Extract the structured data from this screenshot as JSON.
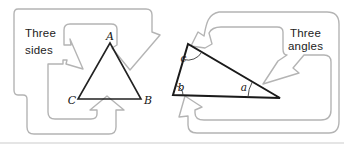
{
  "figure": {
    "left": {
      "caption_line1": "Three",
      "caption_line2": "sides",
      "vertex_top": "A",
      "vertex_bottom_left": "C",
      "vertex_bottom_right": "B"
    },
    "right": {
      "caption_line1": "Three",
      "caption_line2": "angles",
      "angle_top": "c",
      "angle_bottom_left": "b",
      "angle_bottom_right": "a"
    },
    "colors": {
      "arrow_outline": "#b4b4b4",
      "triangle_left": "#222222",
      "triangle_right": "#1a1a1a",
      "angle_arc": "#3a3a3a",
      "bottom_rule": "#cccccc"
    }
  }
}
